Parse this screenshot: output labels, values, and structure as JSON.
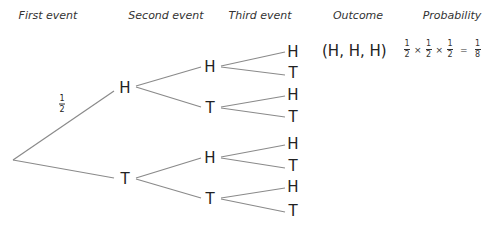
{
  "headers": {
    "first": "First event",
    "second": "Second event",
    "third": "Third event",
    "outcome": "Outcome",
    "probability": "Probability"
  },
  "branch_label": {
    "num": "1",
    "den": "2"
  },
  "tree": {
    "level1": [
      "H",
      "T"
    ],
    "level2": [
      "H",
      "T",
      "H",
      "T"
    ],
    "level3": [
      "H",
      "T",
      "H",
      "T",
      "H",
      "T",
      "H",
      "T"
    ]
  },
  "outcome_row": {
    "outcome": "(H, H, H)",
    "terms": [
      {
        "num": "1",
        "den": "2"
      },
      {
        "num": "1",
        "den": "2"
      },
      {
        "num": "1",
        "den": "2"
      }
    ],
    "times": "×",
    "equals": "=",
    "result": {
      "num": "1",
      "den": "8"
    }
  },
  "colors": {
    "line": "#8a8a8a",
    "text": "#222222"
  }
}
